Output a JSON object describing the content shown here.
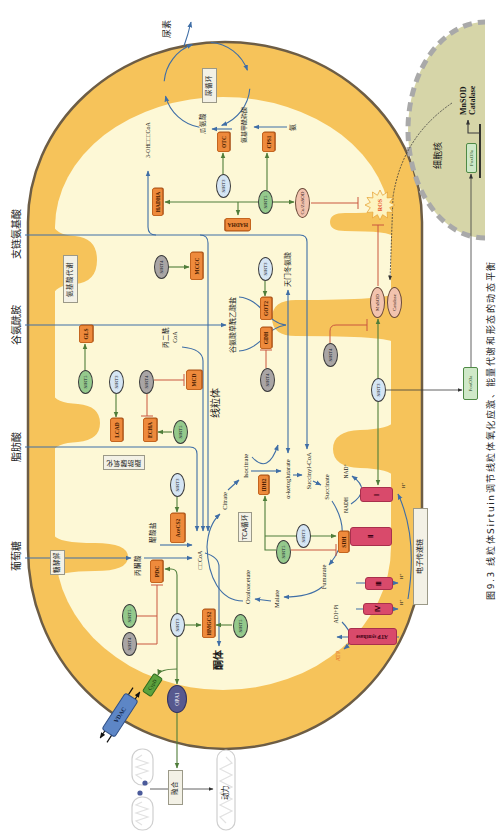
{
  "figure": {
    "caption": "图9.3  线粒体Sirtuin调节线粒体氧化应激、能量代谢和形态的动态平衡"
  },
  "inputs": {
    "bcaa": "支链氨基酸",
    "glutamine": "谷氨酰胺",
    "fatty_acid": "脂肪酸",
    "glucose": "葡萄糖"
  },
  "compartments": {
    "mitochondrion": "线粒体",
    "nucleus": "细胞核"
  },
  "pathways": {
    "urea_cycle": "尿循环",
    "amino_acid_metabolism": "氨基酸代谢",
    "fatty_acid_oxidation": "脂肪酸氧化",
    "glycolysis": "糖酵解",
    "tca_cycle": "TCA循环",
    "electron_transport_chain": "电子传递链",
    "fusion": "融合"
  },
  "metabolites": {
    "urea": "尿素",
    "citrulline": "瓜氨酸",
    "carbamoyl_phosphate": "氨基甲酰磷酸",
    "ammonia": "氨",
    "hydroxyacyl_coa": "3-OH□□□CoA",
    "glutamate_oxaloacetate": "谷氨酸草酰乙酸盐",
    "aspartate": "天门冬氨酸",
    "malonyl_coa": [
      "丙二酰",
      "CoA"
    ],
    "acetate": "醋酸盐",
    "pyruvate": "丙酮酸",
    "acetyl_coa": "□□CoA",
    "ketone_bodies": "酮体"
  },
  "tca": {
    "citrate": "Citrate",
    "isocitrate": "Isocitrate",
    "alpha_ketoglutarate": "α-ketoglutarate",
    "succinyl_coa": "Succinyl-CoA",
    "succinate": "Succinate",
    "fumarate": "Fumarate",
    "malate": "Malate",
    "oxaloacetate": "Oxaloacetate"
  },
  "etc": {
    "nadh": "NADH",
    "nad": "NAD⁺",
    "complex_1": "Ⅰ",
    "complex_2": "Ⅱ",
    "complex_3": "Ⅲ",
    "complex_4": "Ⅳ",
    "atp_synthase": "ATP synthase",
    "proton": "H⁺",
    "adp_pi": "ADI+Pi",
    "atp": "ATP"
  },
  "enzymes": {
    "otc": "OTC",
    "cps1": "CPS1",
    "hadha": "HADHA",
    "mccc": "MCCC",
    "gls": "GLS",
    "mcd": "MCD",
    "lcad": "LCAD",
    "echa": "ECHA",
    "got2": "GOT2",
    "gdh": "GDH",
    "acecs2": "AceCS2",
    "pdc": "PDC",
    "idh2": "IDH2",
    "sdh": "SDH",
    "hmgcs2": "HMGCS2"
  },
  "antioxidants": {
    "cuznsod": "Cu/ZnSOD",
    "mnsod": "MnSOD",
    "catalase": "Catalase",
    "ros": "ROS"
  },
  "dynamics": {
    "vdac": "VDAC",
    "cypd": "CypD",
    "opa1": "OPA1",
    "motility": "动力"
  },
  "transcription": {
    "foxo3a": "FoxO3a",
    "target_genes": [
      "MnSOD",
      "Catalase"
    ]
  },
  "sirtuins": [
    {
      "label": "SIRT3",
      "targets": "OTC",
      "effect": "activation"
    },
    {
      "label": "SIRT5",
      "targets": "HADHA, CPS1, Cu/ZnSOD",
      "effect": "activation"
    },
    {
      "label": "SIRT4",
      "targets": "MCCC",
      "effect": "activation"
    },
    {
      "label": "SIRT3",
      "targets": "GOT2",
      "effect": "activation"
    },
    {
      "label": "SIRT5",
      "targets": "GLS",
      "effect": "activation"
    },
    {
      "label": "SIRT3",
      "targets": "LCAD",
      "effect": "activation"
    },
    {
      "label": "SIRT4",
      "targets": "MCD, ECHA",
      "effect": "inhibition"
    },
    {
      "label": "SIRT4",
      "targets": "GDH",
      "effect": "inhibition"
    },
    {
      "label": "SIRT4",
      "targets": "MnSOD",
      "effect": "inhibition"
    },
    {
      "label": "SIRT3",
      "targets": "MnSOD, Complex I, FoxO3a",
      "effect": "activation"
    },
    {
      "label": "SIRT5",
      "targets": "ECHA",
      "effect": "activation"
    },
    {
      "label": "SIRT3",
      "targets": "AceCS2",
      "effect": "activation"
    },
    {
      "label": "SIRT3",
      "targets": "IDH2, SDH",
      "effect": "activation"
    },
    {
      "label": "SIRT5",
      "targets": "IDH2 / SDH",
      "effect": "activation / inhibition"
    },
    {
      "label": "SIRT5",
      "targets": "PDC",
      "effect": "inhibition"
    },
    {
      "label": "SIRT4",
      "targets": "PDC",
      "effect": "inhibition"
    },
    {
      "label": "SIRT3",
      "targets": "PDC, HMGCS2, OPA1, CypD",
      "effect": "activation"
    },
    {
      "label": "SIRT5",
      "targets": "HMGCS2",
      "effect": "activation"
    }
  ],
  "colors": {
    "matrix": "#fdf8d6",
    "membrane": "#f6c35a",
    "outer_membrane_line": "#6d5d45",
    "enzyme": "#ee8a3c",
    "sirt3": "#d5e5f4",
    "sirt4": "#a9a5a5",
    "sirt5": "#94c98c",
    "flux_arrow": "#3f6ea6",
    "activation_arrow": "#4f7d3a",
    "inhibition": "#c9563e",
    "complex": "#d94a6b",
    "nucleus": "#d6d5a8",
    "ros_text": "#e8502a",
    "atp_text": "#e46a2a"
  }
}
